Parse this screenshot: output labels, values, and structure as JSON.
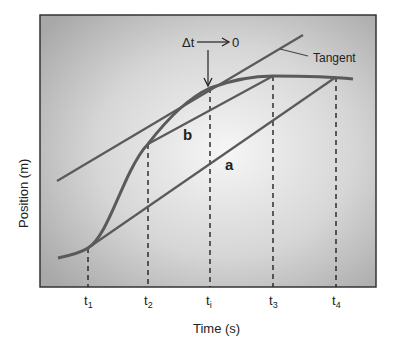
{
  "figure": {
    "x_axis_label": "Time (s)",
    "y_axis_label": "Position (m)",
    "tick_labels": [
      {
        "main": "t",
        "sub": "1"
      },
      {
        "main": "t",
        "sub": "2"
      },
      {
        "main": "t",
        "sub": "i"
      },
      {
        "main": "t",
        "sub": "3"
      },
      {
        "main": "t",
        "sub": "4"
      }
    ],
    "annotations": {
      "delta_t": "Δt",
      "limit_target": "0",
      "tangent": "Tangent",
      "secant_a": "a",
      "secant_b": "b"
    },
    "colors": {
      "curve": "#5a5a5a",
      "background_center": "#f4f4f4",
      "background_edge": "#a9a9a9",
      "frame": "#333333"
    }
  }
}
